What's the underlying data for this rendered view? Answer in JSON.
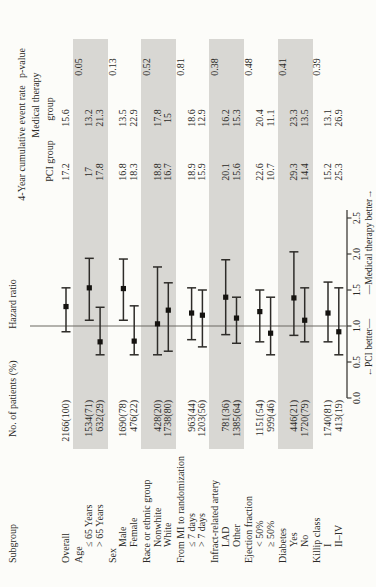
{
  "header": {
    "subgroup": "Subgroup",
    "patients": "No. of patients (%)",
    "hazard_ratio": "Hazard ratio",
    "event_rate_line": "4-Year cumulative event rate",
    "p_value": "p-value",
    "medical_therapy": "Medical therapy",
    "pci_group": "PCI group",
    "group_word": "group"
  },
  "axis": {
    "ticks": [
      "0.0",
      "0.5",
      "1.0",
      "1.5",
      "2.0",
      "2.5"
    ],
    "min": 0.0,
    "max": 2.5,
    "reference": 1.0,
    "left_label": "←PCI better—",
    "right_label": "—Medical therapy better→"
  },
  "colors": {
    "band": "#d8d7d3",
    "text": "#2b2a27",
    "axis_line": "#3f3d39",
    "error_bar": "#2e2c29",
    "marker": "#151310",
    "reference_line": "#6b6862",
    "background": "#fcfcf9"
  },
  "chart_data": {
    "type": "scatter",
    "variant": "forest-plot",
    "xlabel": "Hazard ratio",
    "xlim": [
      0.0,
      2.6
    ],
    "reference_value": 1.0,
    "rows": [
      {
        "label": "Overall",
        "level": "overall",
        "patients": "2166(100)",
        "pci": "17.2",
        "medical": "15.6",
        "hr": 1.27,
        "lo": 0.92,
        "hi": 1.53
      },
      {
        "label": "Age",
        "level": "group",
        "p": "0.05",
        "shaded": true
      },
      {
        "label": "≤ 65 Years",
        "level": "sub",
        "patients": "1534(71)",
        "pci": "17",
        "medical": "13.2",
        "hr": 1.53,
        "lo": 1.08,
        "hi": 1.94
      },
      {
        "label": "> 65 Years",
        "level": "sub",
        "patients": "632(29)",
        "pci": "17.8",
        "medical": "21.3",
        "hr": 0.78,
        "lo": 0.6,
        "hi": 1.26
      },
      {
        "label": "Sex",
        "level": "group",
        "p": "0.13",
        "shaded": false
      },
      {
        "label": "Male",
        "level": "sub",
        "patients": "1690(78)",
        "pci": "16.8",
        "medical": "13.5",
        "hr": 1.52,
        "lo": 1.08,
        "hi": 1.93
      },
      {
        "label": "Female",
        "level": "sub",
        "patients": "476(22)",
        "pci": "18.3",
        "medical": "22.9",
        "hr": 0.79,
        "lo": 0.6,
        "hi": 1.28
      },
      {
        "label": "Race or ethnic group",
        "level": "group",
        "p": "0.52",
        "shaded": true
      },
      {
        "label": "Nonwhite",
        "level": "sub",
        "patients": "428(20)",
        "pci": "18.8",
        "medical": "17.8",
        "hr": 1.03,
        "lo": 0.6,
        "hi": 1.82
      },
      {
        "label": "White",
        "level": "sub",
        "patients": "1738(80)",
        "pci": "16.7",
        "medical": "15",
        "hr": 1.22,
        "lo": 0.65,
        "hi": 1.6
      },
      {
        "label": "From MI to randomization",
        "level": "group",
        "p": "0.81",
        "shaded": false
      },
      {
        "label": "≤ 7 days",
        "level": "sub",
        "patients": "963(44)",
        "pci": "18.9",
        "medical": "18.6",
        "hr": 1.18,
        "lo": 0.81,
        "hi": 1.53
      },
      {
        "label": "> 7 days",
        "level": "sub",
        "patients": "1203(56)",
        "pci": "15.9",
        "medical": "12.9",
        "hr": 1.15,
        "lo": 0.71,
        "hi": 1.5
      },
      {
        "label": "Infract-related artery",
        "level": "group",
        "p": "0.38",
        "shaded": true
      },
      {
        "label": "LAD",
        "level": "sub",
        "patients": "781(36)",
        "pci": "20.1",
        "medical": "16.2",
        "hr": 1.4,
        "lo": 0.88,
        "hi": 1.92
      },
      {
        "label": "Other",
        "level": "sub",
        "patients": "1385(64)",
        "pci": "15.6",
        "medical": "15.3",
        "hr": 1.11,
        "lo": 0.76,
        "hi": 1.4
      },
      {
        "label": "Ejection fraction",
        "level": "group",
        "p": "0.48",
        "shaded": false
      },
      {
        "label": "< 50%",
        "level": "sub",
        "patients": "1151(54)",
        "pci": "22.6",
        "medical": "20.4",
        "hr": 1.2,
        "lo": 0.78,
        "hi": 1.5
      },
      {
        "label": "≥ 50%",
        "level": "sub",
        "patients": "999(46)",
        "pci": "10.7",
        "medical": "11.1",
        "hr": 0.9,
        "lo": 0.6,
        "hi": 1.4
      },
      {
        "label": "Diabetes",
        "level": "group",
        "p": "0.41",
        "shaded": true
      },
      {
        "label": "Yes",
        "level": "sub",
        "patients": "446(21)",
        "pci": "29.3",
        "medical": "23.3",
        "hr": 1.39,
        "lo": 0.87,
        "hi": 2.03
      },
      {
        "label": "No",
        "level": "sub",
        "patients": "1720(79)",
        "pci": "14.4",
        "medical": "13.5",
        "hr": 1.08,
        "lo": 0.78,
        "hi": 1.53
      },
      {
        "label": "Killip class",
        "level": "group",
        "p": "0.39",
        "shaded": false
      },
      {
        "label": "I",
        "level": "sub",
        "patients": "1740(81)",
        "pci": "15.2",
        "medical": "13.1",
        "hr": 1.18,
        "lo": 0.78,
        "hi": 1.61
      },
      {
        "label": "II–IV",
        "level": "sub",
        "patients": "413(19)",
        "pci": "25.3",
        "medical": "26.9",
        "hr": 0.92,
        "lo": 0.6,
        "hi": 1.53
      }
    ]
  }
}
